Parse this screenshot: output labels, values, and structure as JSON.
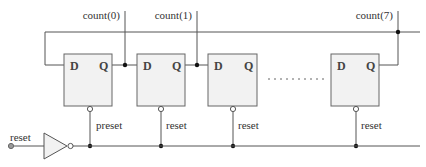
{
  "diagram": {
    "type": "ring-counter-schematic",
    "outputs": {
      "count0": "count(0)",
      "count1": "count(1)",
      "count7": "count(7)"
    },
    "flip_flops": [
      {
        "id": "ff0",
        "d_label": "D",
        "q_label": "Q",
        "ctrl_label": "preset"
      },
      {
        "id": "ff1",
        "d_label": "D",
        "q_label": "Q",
        "ctrl_label": "reset"
      },
      {
        "id": "ff2",
        "d_label": "D",
        "q_label": "Q",
        "ctrl_label": "reset"
      },
      {
        "id": "ff7",
        "d_label": "D",
        "q_label": "Q",
        "ctrl_label": "reset"
      }
    ],
    "input": {
      "label": "reset"
    },
    "ellipsis": "..........",
    "colors": {
      "wire": "#555555",
      "box_fill": "#f2f2f2",
      "box_stroke": "#666666",
      "junction": "#111111"
    }
  }
}
